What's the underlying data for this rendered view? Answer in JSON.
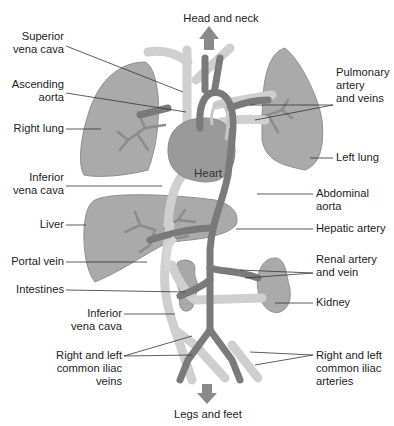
{
  "diagram": {
    "top_label": "Head and neck",
    "bottom_label": "Legs and feet",
    "center_label": "Heart",
    "labels_left": [
      {
        "id": "superior-vena-cava",
        "line1": "Superior",
        "line2": "vena cava"
      },
      {
        "id": "ascending-aorta",
        "line1": "Ascending",
        "line2": "aorta"
      },
      {
        "id": "right-lung",
        "line1": "Right lung"
      },
      {
        "id": "inferior-vena-cava-upper",
        "line1": "Inferior",
        "line2": "vena cava"
      },
      {
        "id": "liver",
        "line1": "Liver"
      },
      {
        "id": "portal-vein",
        "line1": "Portal vein"
      },
      {
        "id": "intestines",
        "line1": "Intestines"
      },
      {
        "id": "inferior-vena-cava-lower",
        "line1": "Inferior",
        "line2": "vena cava"
      },
      {
        "id": "common-iliac-veins",
        "line1": "Right and left",
        "line2": "common iliac",
        "line3": "veins"
      }
    ],
    "labels_right": [
      {
        "id": "pulmonary-artery-veins",
        "line1": "Pulmonary",
        "line2": "artery",
        "line3": "and veins"
      },
      {
        "id": "left-lung",
        "line1": "Left lung"
      },
      {
        "id": "abdominal-aorta",
        "line1": "Abdominal",
        "line2": "aorta"
      },
      {
        "id": "hepatic-artery",
        "line1": "Hepatic artery"
      },
      {
        "id": "renal-artery-vein",
        "line1": "Renal artery",
        "line2": "and vein"
      },
      {
        "id": "kidney",
        "line1": "Kidney"
      },
      {
        "id": "common-iliac-arteries",
        "line1": "Right and left",
        "line2": "common iliac",
        "line3": "arteries"
      }
    ],
    "colors": {
      "organ_fill": "#a9a9a9",
      "organ_stroke": "#8f8f8f",
      "artery": "#7a7a7a",
      "vein": "#cfcfcf",
      "arrow": "#888888",
      "leader_line": "#333333",
      "background": "#ffffff"
    }
  }
}
